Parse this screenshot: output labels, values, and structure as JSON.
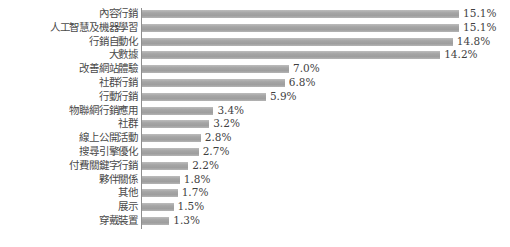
{
  "chart_data": {
    "type": "bar",
    "orientation": "horizontal",
    "title": "",
    "subtitle": "",
    "xlabel": "",
    "ylabel": "",
    "grid": false,
    "legend": false,
    "legend_position": "none",
    "axis_line": true,
    "value_label_suffix": "%",
    "xlim": [
      0,
      15.1
    ],
    "bar_color": "#a9a9a9",
    "text_color": "#444444",
    "categories": [
      "內容行銷",
      "人工智慧及機器學習",
      "行銷自動化",
      "大數據",
      "改善網站體驗",
      "社群行銷",
      "行動行銷",
      "物聯網行銷應用",
      "社群",
      "線上公開活動",
      "搜尋引擎優化",
      "付費關鍵字行銷",
      "夥伴關係",
      "其他",
      "展示",
      "穿戴裝置"
    ],
    "values": [
      15.1,
      15.1,
      14.8,
      14.2,
      7.0,
      6.8,
      5.9,
      3.4,
      3.2,
      2.8,
      2.7,
      2.2,
      1.8,
      1.7,
      1.5,
      1.3
    ],
    "value_labels": [
      "15.1%",
      "15.1%",
      "14.8%",
      "14.2%",
      "7.0%",
      "6.8%",
      "5.9%",
      "3.4%",
      "3.2%",
      "2.8%",
      "2.7%",
      "2.2%",
      "1.8%",
      "1.7%",
      "1.5%",
      "1.3%"
    ]
  }
}
